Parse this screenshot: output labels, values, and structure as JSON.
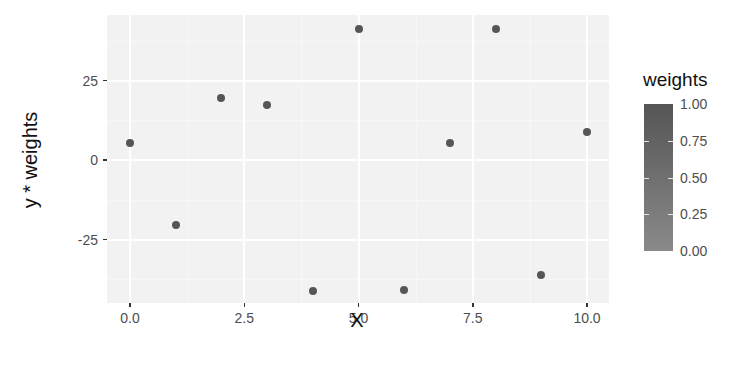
{
  "chart_data": {
    "type": "scatter",
    "title": "",
    "xlabel": "X",
    "ylabel": "y * weights",
    "x_ticks": [
      0.0,
      2.5,
      5.0,
      7.5,
      10.0
    ],
    "x_tick_labels": [
      "0.0",
      "2.5",
      "5.0",
      "7.5",
      "10.0"
    ],
    "y_ticks": [
      -25,
      0,
      25
    ],
    "y_tick_labels": [
      "-25",
      "0",
      "25"
    ],
    "xlim": [
      -0.5,
      10.5
    ],
    "ylim": [
      -45,
      45
    ],
    "grid": true,
    "legend": {
      "title": "weights",
      "type": "colorbar",
      "position": "right",
      "breaks": [
        0.0,
        0.25,
        0.5,
        0.75,
        1.0
      ],
      "labels": [
        "0.00",
        "0.25",
        "0.50",
        "0.75",
        "1.00"
      ],
      "low_color": "#8a8a8a",
      "high_color": "#555555"
    },
    "points": [
      {
        "x": 0,
        "y": 5.3,
        "weight": 1.0
      },
      {
        "x": 1,
        "y": -20.5,
        "weight": 1.0
      },
      {
        "x": 2,
        "y": 19.5,
        "weight": 1.0
      },
      {
        "x": 3,
        "y": 17.3,
        "weight": 1.0
      },
      {
        "x": 4,
        "y": -41.2,
        "weight": 1.0
      },
      {
        "x": 5,
        "y": 41.2,
        "weight": 1.0
      },
      {
        "x": 6,
        "y": -41.0,
        "weight": 1.0
      },
      {
        "x": 7,
        "y": 5.3,
        "weight": 1.0
      },
      {
        "x": 8,
        "y": 41.2,
        "weight": 1.0
      },
      {
        "x": 9,
        "y": -36.2,
        "weight": 1.0
      },
      {
        "x": 10,
        "y": 8.8,
        "weight": 1.0
      }
    ]
  }
}
